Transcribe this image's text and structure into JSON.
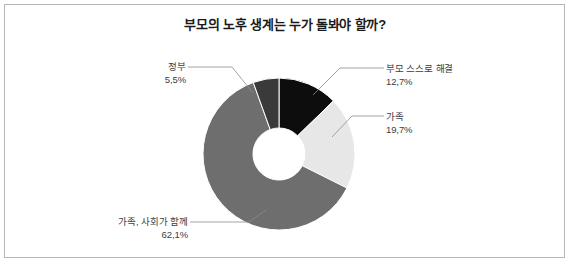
{
  "chart_data": {
    "type": "pie",
    "variant": "donut",
    "title": "부모의 노후 생계는 누가 돌봐야 할까?",
    "xlabel": "",
    "ylabel": "",
    "legend": "none",
    "grid": false,
    "unit": "%",
    "start_angle_deg": 0,
    "direction": "clockwise",
    "categories": [
      "부모 스스로 해결",
      "가족",
      "가족, 사회가 함께",
      "정부"
    ],
    "values": [
      12.7,
      19.7,
      62.1,
      5.5
    ],
    "colors": [
      "#0d0d0d",
      "#e7e7e7",
      "#6e6e6e",
      "#3a3a3a"
    ],
    "slices": [
      {
        "label": "부모 스스로 해결",
        "pct_text": "12,7%",
        "value": 12.7,
        "color": "#0d0d0d"
      },
      {
        "label": "가족",
        "pct_text": "19,7%",
        "value": 19.7,
        "color": "#e7e7e7"
      },
      {
        "label": "가족, 사회가 함께",
        "pct_text": "62,1%",
        "value": 62.1,
        "color": "#6e6e6e"
      },
      {
        "label": "정부",
        "pct_text": "5,5%",
        "value": 5.5,
        "color": "#3a3a3a"
      }
    ],
    "geometry": {
      "center_x": 279,
      "center_y": 154,
      "outer_radius": 76,
      "inner_radius": 26
    }
  },
  "callouts": {
    "government": {
      "label": "정부",
      "pct_text": "5,5%"
    },
    "self": {
      "label": "부모 스스로 해결",
      "pct_text": "12,7%"
    },
    "family": {
      "label": "가족",
      "pct_text": "19,7%"
    },
    "family_society": {
      "label": "가족, 사회가 함께",
      "pct_text": "62,1%"
    }
  },
  "style": {
    "frame_color": "#b6b6b6",
    "leader_color": "#8c8c8c",
    "text_color": "#3d3d3d",
    "title_color": "#1a1a1a",
    "background": "#ffffff"
  }
}
